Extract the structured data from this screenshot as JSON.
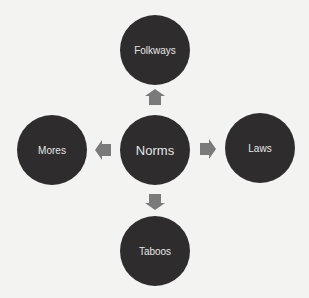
{
  "diagram": {
    "center": {
      "label": "Norms"
    },
    "top": {
      "label": "Folkways"
    },
    "left": {
      "label": "Mores"
    },
    "right": {
      "label": "Laws"
    },
    "bottom": {
      "label": "Taboos"
    }
  },
  "colors": {
    "background": "#f3f3f1",
    "node_fill": "#2e2c2d",
    "node_text": "#e6e6e6",
    "arrow_fill": "#7a7a7a"
  }
}
